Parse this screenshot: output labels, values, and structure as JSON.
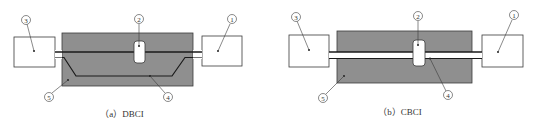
{
  "colors": {
    "device_fill": "#8f8f8f",
    "stroke": "#3a3a3a",
    "box_fill": "#ffffff",
    "background": "#ffffff"
  },
  "panels": [
    {
      "id": "a",
      "caption": "（a）DBCI",
      "labels": {
        "l1": "1",
        "l2": "2",
        "l3": "3",
        "l4": "4",
        "l5": "5"
      }
    },
    {
      "id": "b",
      "caption": "（b）CBCI",
      "labels": {
        "l1": "1",
        "l2": "2",
        "l3": "3",
        "l4": "4",
        "l5": "5"
      }
    }
  ]
}
